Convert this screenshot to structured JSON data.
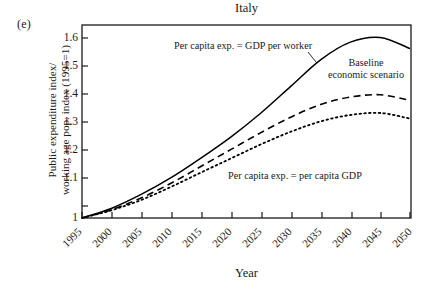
{
  "figure": {
    "panel_letter": "(e)",
    "title": "Italy"
  },
  "axes": {
    "ylabel_line1": "Public expenditure index/",
    "ylabel_line2": "working age pop. index (1995=1)",
    "xlabel": "Year",
    "ytick_labels": [
      "1.6",
      "1.5",
      "1.4",
      "1.3",
      "1.2",
      "1.1",
      "1"
    ],
    "xtick_labels": [
      "1995",
      "2000",
      "2005",
      "2010",
      "2015",
      "2020",
      "2025",
      "2030",
      "2035",
      "2040",
      "2045",
      "2050"
    ]
  },
  "annotations": {
    "gdp_per_worker": "Per capita exp. = GDP per worker",
    "per_capita_gdp": "Per capita exp. = per capita GDP",
    "baseline_line1": "Baseline",
    "baseline_line2": "economic scenario"
  },
  "colors": {
    "axis": "#1a1a1a",
    "curve": "#000000",
    "background": "#ffffff"
  },
  "chart_data": {
    "type": "line",
    "title": "Italy",
    "xlabel": "Year",
    "ylabel": "Public expenditure index/working age pop. index (1995=1)",
    "xlim": [
      1995,
      2050
    ],
    "ylim": [
      1.0,
      1.645
    ],
    "grid": false,
    "legend": "in-plot annotations",
    "x": [
      1995,
      2000,
      2005,
      2010,
      2015,
      2020,
      2025,
      2030,
      2035,
      2040,
      2045,
      2050
    ],
    "series": [
      {
        "name": "Per capita exp. = GDP per worker",
        "style": "solid",
        "values": [
          1.0,
          1.035,
          1.085,
          1.145,
          1.215,
          1.29,
          1.375,
          1.47,
          1.565,
          1.628,
          1.645,
          1.605
        ]
      },
      {
        "name": "Baseline economic scenario",
        "style": "dashed",
        "values": [
          1.0,
          1.03,
          1.072,
          1.125,
          1.185,
          1.245,
          1.305,
          1.36,
          1.405,
          1.432,
          1.44,
          1.42
        ]
      },
      {
        "name": "Per capita exp. = per capita GDP",
        "style": "dotted",
        "values": [
          1.0,
          1.028,
          1.065,
          1.112,
          1.163,
          1.213,
          1.263,
          1.308,
          1.345,
          1.368,
          1.375,
          1.355
        ]
      }
    ]
  }
}
